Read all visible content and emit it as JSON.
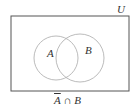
{
  "diagram": {
    "type": "venn",
    "universe_label": "U",
    "sets": [
      {
        "label": "A"
      },
      {
        "label": "B"
      }
    ],
    "caption": {
      "complement_set": "A",
      "operator": " ∩ ",
      "other_set": "B"
    },
    "shaded_region": "none",
    "colors": {
      "box_stroke": "#555555",
      "circle_stroke": "#aaaaaa",
      "text": "#333333",
      "background": "#ffffff"
    }
  }
}
